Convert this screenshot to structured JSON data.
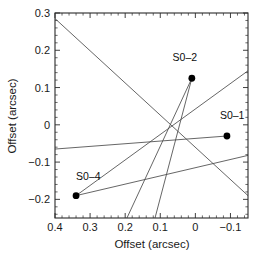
{
  "figure": {
    "title": "",
    "background": "#ffffff",
    "width": 264,
    "height": 264
  },
  "axes": {
    "x_title": "Offset (arcsec)",
    "y_title": "Offset (arcsec)",
    "x_ticklabels": [
      "0.4",
      "0.3",
      "0.2",
      "0.1",
      "0",
      "−0.1"
    ],
    "y_ticklabels": [
      "0.3",
      "0.2",
      "0.1",
      "0",
      "−0.1",
      "−0.2"
    ],
    "x_reversed": "true",
    "frame_color": "#2b2b2b"
  },
  "points": {
    "s0_2_label": "S0–2",
    "s0_1_label": "S0–1",
    "s0_4_label": "S0–4"
  },
  "chart_data": {
    "type": "scatter",
    "title": "",
    "xlabel": "Offset (arcsec)",
    "ylabel": "Offset (arcsec)",
    "xlim": [
      0.4,
      -0.15
    ],
    "ylim": [
      -0.25,
      0.3
    ],
    "x_inverted": true,
    "grid": false,
    "legend": "none",
    "xticks": [
      0.4,
      0.3,
      0.2,
      0.1,
      0.0,
      -0.1
    ],
    "xticklabels": [
      "0.4",
      "0.3",
      "0.2",
      "0.1",
      "0",
      "−0.1"
    ],
    "yticks": [
      0.3,
      0.2,
      0.1,
      0.0,
      -0.1,
      -0.2
    ],
    "yticklabels": [
      "0.3",
      "0.2",
      "0.1",
      "0",
      "−0.1",
      "−0.2"
    ],
    "x_minor_tick_step": 0.02,
    "y_minor_tick_step": 0.02,
    "marker_color": "#000000",
    "line_color": "#4a4a4a",
    "points": [
      {
        "name": "S0–2",
        "x": 0.01,
        "y": 0.125,
        "label_dx": -0.02,
        "label_dy": 0.045
      },
      {
        "name": "S0–1",
        "x": -0.09,
        "y": -0.03,
        "label_dx": 0.015,
        "label_dy": 0.045
      },
      {
        "name": "S0–4",
        "x": 0.34,
        "y": -0.19,
        "label_dx": 0.035,
        "label_dy": 0.042
      }
    ],
    "annotations": [
      {
        "text": "S0–2",
        "x": 0.03,
        "y": 0.17
      },
      {
        "text": "S0–1",
        "x": -0.105,
        "y": 0.015
      },
      {
        "text": "S0–4",
        "x": 0.305,
        "y": -0.148
      }
    ],
    "series": [
      {
        "name": "orbit-trace-1",
        "comment": "long shallow diagonal from upper-left corner down to lower-right area",
        "x": [
          0.4,
          -0.15
        ],
        "y": [
          0.285,
          -0.19
        ]
      },
      {
        "name": "orbit-trace-2",
        "comment": "near-horizontal line from left edge through S0-1",
        "x": [
          0.4,
          -0.09
        ],
        "y": [
          -0.065,
          -0.03
        ]
      },
      {
        "name": "orbit-trace-3",
        "comment": "shallow rising line from S0-4 to the right edge",
        "x": [
          0.34,
          -0.15
        ],
        "y": [
          -0.19,
          -0.082
        ]
      },
      {
        "name": "orbit-trace-4",
        "comment": "rising line from S0-4 up through centre to the upper right edge",
        "x": [
          0.34,
          -0.15
        ],
        "y": [
          -0.19,
          0.145
        ]
      },
      {
        "name": "orbit-trace-5",
        "comment": "steep line from S0-2 down to bottom edge",
        "x": [
          0.01,
          0.115
        ],
        "y": [
          0.125,
          -0.25
        ]
      },
      {
        "name": "orbit-trace-6",
        "comment": "steep line from S0-2 down-left to bottom edge",
        "x": [
          0.01,
          0.195
        ],
        "y": [
          0.125,
          -0.25
        ]
      }
    ]
  }
}
